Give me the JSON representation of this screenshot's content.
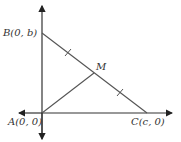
{
  "diagram": {
    "type": "right-triangle-coordinate",
    "colors": {
      "axis": "#333333",
      "line": "#555555",
      "text": "#333333"
    },
    "points": {
      "A": {
        "label": "A(0, 0)",
        "px": [
          42,
          113
        ]
      },
      "B": {
        "label": "B(0, b)",
        "px": [
          42,
          33
        ]
      },
      "C": {
        "label": "C(c, 0)",
        "px": [
          147,
          113
        ]
      },
      "M": {
        "label": "M",
        "px": [
          94,
          73
        ]
      }
    },
    "segments": [
      "AB",
      "BC",
      "AM"
    ],
    "tick_marks": [
      "BM",
      "MC"
    ]
  }
}
